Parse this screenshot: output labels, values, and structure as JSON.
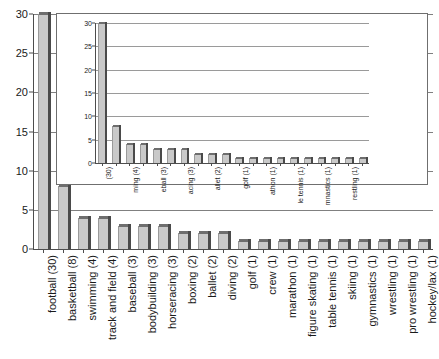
{
  "chart_data": {
    "type": "bar",
    "title": "",
    "subtitle": "",
    "xlabel": "",
    "ylabel": "",
    "ylim": [
      0,
      30
    ],
    "ytick_values": [
      0,
      5,
      10,
      15,
      20,
      25,
      30
    ],
    "ytick_labels": [
      "0",
      "5",
      "10",
      "15",
      "20",
      "25",
      "30"
    ],
    "grid": true,
    "legend": false,
    "categories": [
      "football (30)",
      "basketball (8)",
      "swimming (4)",
      "track and field (4)",
      "baseball (3)",
      "bodybuilding (3)",
      "horseracing (3)",
      "boxing (2)",
      "ballet (2)",
      "diving (2)",
      "golf (1)",
      "crew (1)",
      "marathon (1)",
      "figure skating (1)",
      "table tennis (1)",
      "skiing (1)",
      "gymnastics (1)",
      "wrestling (1)",
      "pro wrestling (1)",
      "hockey/lax (1)"
    ],
    "values": [
      30,
      8,
      4,
      4,
      3,
      3,
      3,
      2,
      2,
      2,
      1,
      1,
      1,
      1,
      1,
      1,
      1,
      1,
      1,
      1
    ],
    "inset": {
      "type": "bar",
      "ylim": [
        0,
        30
      ],
      "ytick_values": [
        0,
        5,
        10,
        15,
        20,
        25,
        30
      ],
      "ytick_labels": [
        "0",
        "5",
        "10",
        "15",
        "20",
        "25",
        "30"
      ],
      "grid": true,
      "categories": [
        "ball (30)",
        "ball (8)",
        "ming (4)",
        "field (4)",
        "eball (3)",
        "ding (3)",
        "acing (3)",
        "xing (2)",
        "allet (2)",
        "ving (2)",
        "golf (1)",
        "crew (1)",
        "athon (1)",
        "ating (1)",
        "tennis (1)",
        "kiing (1)",
        "astics (1)",
        "stling (1)",
        "estling (1)",
        "y/lax (1)"
      ],
      "values": [
        30,
        8,
        4,
        4,
        3,
        3,
        3,
        2,
        2,
        2,
        1,
        1,
        1,
        1,
        1,
        1,
        1,
        1,
        1,
        1
      ],
      "visible_label_indices": [
        0,
        2,
        4,
        6,
        8,
        10,
        12,
        14,
        16,
        18
      ],
      "visible_labels": [
        "(30)",
        "ming (4)",
        "eball (3)",
        "acing (3)",
        "allet (2)",
        "golf (1)",
        "athon (1)",
        "le tennis (1)",
        "mnastics (1)",
        "restling (1)"
      ]
    }
  },
  "colors": {
    "bar_fill": "#c9c9c9",
    "bar_shadow": "#4a4a4a",
    "bar_top": "#6e6e6e",
    "axis": "#4d4d4d",
    "gridline": "#808080",
    "text": "#1a1a1a",
    "background": "#ffffff",
    "inset_border": "#6f6f6f"
  }
}
